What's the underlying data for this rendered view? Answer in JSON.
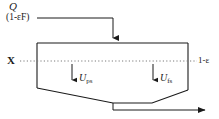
{
  "diagram": {
    "title_label": "Q",
    "feed_label": "(1-εF)",
    "left_axis_label": "X",
    "right_axis_label": "1-ε",
    "flux_particle_label": "U",
    "flux_particle_sub": "ps",
    "flux_fluid_label": "U",
    "flux_fluid_sub": "fs",
    "colors": {
      "line": "#1a1a1a",
      "dotted": "#7a7a7a",
      "background": "#ffffff"
    },
    "geometry": {
      "vessel_top_y": 43,
      "vessel_left_x": 37,
      "vessel_right_x": 188,
      "wall_left_bottom_y": 88,
      "wall_right_bottom_y": 90,
      "funnel_apex_left_x": 113,
      "funnel_apex_right_x": 152,
      "funnel_apex_y": 103,
      "dotted_line_y": 61,
      "inlet_horizontal_y": 18,
      "inlet_vertical_x": 113,
      "outlet_y": 110,
      "outlet_arrow_x": 212
    }
  }
}
